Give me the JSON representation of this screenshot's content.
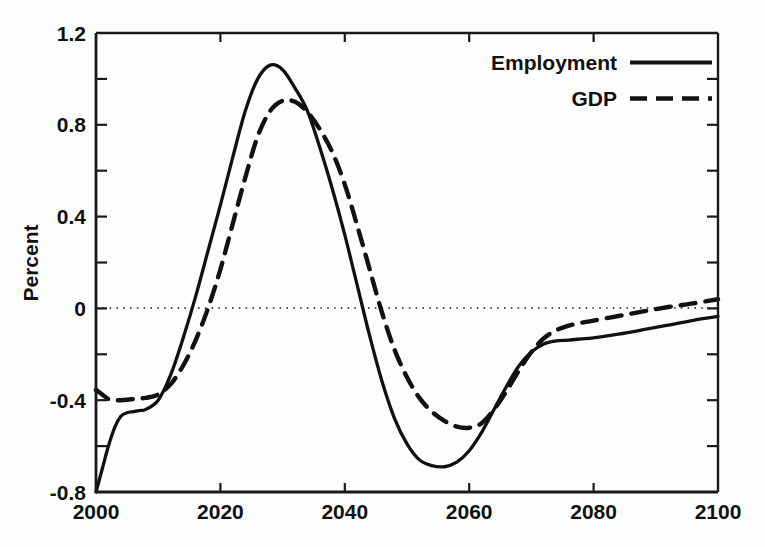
{
  "chart_data": {
    "type": "line",
    "title": "",
    "xlabel": "",
    "ylabel": "Percent",
    "xlim": [
      2000,
      2100
    ],
    "ylim": [
      -0.8,
      1.2
    ],
    "grid": false,
    "zero_line": true,
    "zero_line_style": "dotted",
    "legend_position": "top-right",
    "x_ticks_major": [
      2000,
      2020,
      2040,
      2060,
      2080,
      2100
    ],
    "x_tick_labels": [
      "2000",
      "2020",
      "2040",
      "2060",
      "2080",
      "2100"
    ],
    "y_ticks_major": [
      -0.8,
      -0.4,
      0,
      0.4,
      0.8,
      1.2
    ],
    "y_tick_labels": [
      "-0.8",
      "-0.4",
      "0",
      "0.4",
      "0.8",
      "1.2"
    ],
    "y_ticks_minor": [
      -0.6,
      -0.2,
      0.2,
      0.6,
      1.0
    ],
    "series": [
      {
        "name": "Employment",
        "style": "solid",
        "color": "#111111",
        "x": [
          2000,
          2001,
          2002,
          2003,
          2004,
          2005,
          2006,
          2007,
          2008,
          2010,
          2012,
          2014,
          2016,
          2018,
          2020,
          2022,
          2024,
          2026,
          2028,
          2030,
          2032,
          2034,
          2036,
          2038,
          2040,
          2042,
          2044,
          2046,
          2048,
          2050,
          2052,
          2054,
          2056,
          2058,
          2060,
          2062,
          2064,
          2066,
          2068,
          2070,
          2072,
          2074,
          2076,
          2078,
          2080,
          2084,
          2088,
          2092,
          2096,
          2100
        ],
        "y": [
          -0.8,
          -0.7,
          -0.6,
          -0.52,
          -0.47,
          -0.455,
          -0.45,
          -0.445,
          -0.44,
          -0.4,
          -0.29,
          -0.13,
          0.05,
          0.25,
          0.45,
          0.66,
          0.86,
          1.0,
          1.06,
          1.04,
          0.96,
          0.86,
          0.7,
          0.52,
          0.32,
          0.1,
          -0.12,
          -0.32,
          -0.48,
          -0.59,
          -0.66,
          -0.685,
          -0.69,
          -0.67,
          -0.62,
          -0.54,
          -0.44,
          -0.34,
          -0.25,
          -0.19,
          -0.155,
          -0.142,
          -0.138,
          -0.133,
          -0.128,
          -0.112,
          -0.093,
          -0.073,
          -0.052,
          -0.035
        ]
      },
      {
        "name": "GDP",
        "style": "dashed",
        "color": "#111111",
        "x": [
          2000,
          2001,
          2002,
          2003,
          2004,
          2005,
          2006,
          2007,
          2008,
          2010,
          2012,
          2014,
          2016,
          2018,
          2020,
          2022,
          2024,
          2026,
          2028,
          2030,
          2032,
          2034,
          2036,
          2038,
          2040,
          2042,
          2044,
          2046,
          2048,
          2050,
          2052,
          2054,
          2056,
          2058,
          2060,
          2062,
          2064,
          2066,
          2068,
          2070,
          2072,
          2074,
          2076,
          2078,
          2080,
          2084,
          2088,
          2092,
          2096,
          2100
        ],
        "y": [
          -0.355,
          -0.375,
          -0.395,
          -0.4,
          -0.4,
          -0.398,
          -0.395,
          -0.392,
          -0.39,
          -0.375,
          -0.33,
          -0.25,
          -0.14,
          0.0,
          0.17,
          0.37,
          0.57,
          0.75,
          0.86,
          0.905,
          0.9,
          0.855,
          0.78,
          0.68,
          0.54,
          0.36,
          0.17,
          -0.02,
          -0.18,
          -0.3,
          -0.39,
          -0.45,
          -0.49,
          -0.515,
          -0.52,
          -0.5,
          -0.44,
          -0.36,
          -0.27,
          -0.19,
          -0.13,
          -0.095,
          -0.075,
          -0.063,
          -0.053,
          -0.033,
          -0.013,
          0.006,
          0.022,
          0.04
        ]
      }
    ]
  },
  "axes": {
    "y_axis_title": "Percent",
    "x_tick_labels": [
      "2000",
      "2020",
      "2040",
      "2060",
      "2080",
      "2100"
    ],
    "y_tick_labels": [
      "1.2",
      "0.8",
      "0.4",
      "0",
      "-0.4",
      "-0.8"
    ]
  },
  "legend": {
    "entries": [
      {
        "label": "Employment",
        "style": "solid"
      },
      {
        "label": "GDP",
        "style": "dashed"
      }
    ]
  },
  "colors": {
    "line": "#111111",
    "axis": "#1a1a1a",
    "background": "#fefefe"
  }
}
